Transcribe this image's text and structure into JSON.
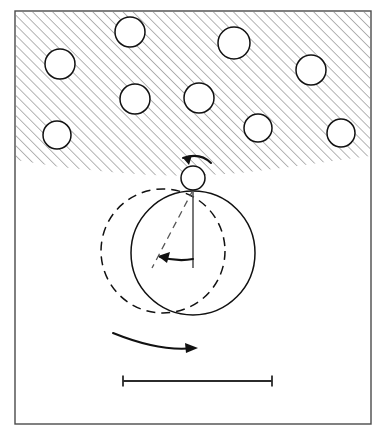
{
  "figure": {
    "domain_type": "diagram",
    "background_color": "#ffffff",
    "frame": {
      "x": 15,
      "y": 11,
      "width": 356,
      "height": 413,
      "stroke_color": "#4a4a4a",
      "stroke_width": 1.4
    }
  },
  "hatched_region": {
    "label": "porous-medium",
    "hatch_angle_degrees": 45,
    "hatch_spacing": 5,
    "hatch_color": "#3a3a3a",
    "fill_color": "#ffffff",
    "boundary_points": "16,160 60,167 110,172 150,175 193,176 240,173 290,167 340,160 370,156",
    "top_y": 12,
    "left_x": 16,
    "right_x": 370
  },
  "grains": {
    "label": "embedded-grain-circles",
    "radius": 15,
    "fill_color": "#ffffff",
    "stroke_color": "#111111",
    "circles": [
      {
        "id": "grain-1",
        "cx": 60,
        "cy": 64,
        "r": 15
      },
      {
        "id": "grain-2",
        "cx": 130,
        "cy": 32,
        "r": 15
      },
      {
        "id": "grain-3",
        "cx": 135,
        "cy": 99,
        "r": 15
      },
      {
        "id": "grain-4",
        "cx": 57,
        "cy": 135,
        "r": 14
      },
      {
        "id": "grain-5",
        "cx": 234,
        "cy": 43,
        "r": 16
      },
      {
        "id": "grain-6",
        "cx": 311,
        "cy": 70,
        "r": 15
      },
      {
        "id": "grain-7",
        "cx": 199,
        "cy": 98,
        "r": 15
      },
      {
        "id": "grain-8",
        "cx": 258,
        "cy": 128,
        "r": 14
      },
      {
        "id": "grain-9",
        "cx": 341,
        "cy": 133,
        "r": 14
      }
    ]
  },
  "small_particle": {
    "label": "contact-particle",
    "cx": 193,
    "cy": 178,
    "r": 12,
    "fill_color": "#ffffff",
    "stroke_color": "#111111"
  },
  "large_circle_current": {
    "label": "particle-current-position",
    "cx": 193,
    "cy": 253,
    "r": 62,
    "style": "solid",
    "stroke_color": "#111111"
  },
  "large_circle_previous": {
    "label": "particle-previous-position",
    "cx": 163,
    "cy": 251,
    "r": 62,
    "style": "dashed",
    "stroke_color": "#111111"
  },
  "reference_line": {
    "label": "vertical-reference-line",
    "x1": 193,
    "y1": 190,
    "x2": 193,
    "y2": 268,
    "stroke_color": "#555555"
  },
  "radius_line": {
    "label": "rotated-radius-line",
    "x1": 193,
    "y1": 190,
    "x2": 152,
    "y2": 268,
    "style": "dashed",
    "stroke_color": "#555555"
  },
  "arrows": {
    "spin_arrow": {
      "label": "spin-rotation-arrow",
      "direction": "counterclockwise",
      "path": "M 211 163 Q 200 152 183 158",
      "head_points": "183,158 192,155 189,165"
    },
    "angle_arrow": {
      "label": "rotation-angle-arc-arrow",
      "direction": "counterclockwise",
      "path": "M 193 259 Q 178 262 160 257",
      "head_points": "158,256 170,252 167,263"
    },
    "rolling_arrow": {
      "label": "rolling-direction-arrow",
      "direction": "clockwise",
      "path": "M 113 333 Q 160 352 194 348",
      "head_points": "198,348 185,343 186,353"
    }
  },
  "scale_bar": {
    "label": "scale-bar",
    "x_start": 123,
    "x_end": 272,
    "y": 381,
    "cap_height": 11,
    "stroke_color": "#2b2b2b",
    "caption": ""
  }
}
